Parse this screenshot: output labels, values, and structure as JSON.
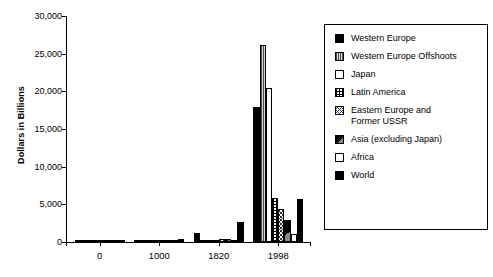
{
  "chart_data": {
    "type": "bar",
    "title": "",
    "subtitle": "",
    "xlabel": "",
    "ylabel": "Dollars in Billions",
    "categories": [
      "0",
      "1000",
      "1820",
      "1998"
    ],
    "xtick_labels": [
      "0",
      "1000",
      "1820",
      "1998"
    ],
    "ytick_labels": [
      "0",
      "5,000",
      "10,000",
      "15,000",
      "20,000",
      "25,000",
      "30,000"
    ],
    "ytick_values": [
      0,
      5000,
      10000,
      15000,
      20000,
      25000,
      30000
    ],
    "ylim": [
      0,
      30000
    ],
    "grid": false,
    "legend_position": "right",
    "series": [
      {
        "name": "Western Europe",
        "pattern": "solid",
        "values": [
          110,
          134,
          1196,
          17966
        ]
      },
      {
        "name": "Western Europe Offshoots",
        "pattern": "vstripe",
        "values": [
          14,
          16,
          189,
          26147
        ]
      },
      {
        "name": "Japan",
        "pattern": "white",
        "values": [
          12,
          32,
          205,
          20410
        ]
      },
      {
        "name": "Latin America",
        "pattern": "dots",
        "values": [
          16,
          23,
          221,
          5795
        ]
      },
      {
        "name": "Eastern Europe and\nFormer USSR",
        "pattern": "crosshatch",
        "values": [
          19,
          38,
          362,
          4354
        ]
      },
      {
        "name": "Asia (excluding Japan)",
        "pattern": "halfsolid",
        "values": [
          74,
          171,
          392,
          2937
        ]
      },
      {
        "name": "Africa",
        "pattern": "empty",
        "values": [
          11,
          19,
          76,
          1039
        ]
      },
      {
        "name": "World",
        "pattern": "world",
        "values": [
          256,
          433,
          2641,
          5709
        ]
      }
    ]
  },
  "axis": {
    "y_title": "Dollars in Billions"
  },
  "legend": {
    "items": [
      {
        "label": "Western Europe"
      },
      {
        "label": "Western Europe Offshoots"
      },
      {
        "label": "Japan"
      },
      {
        "label": "Latin America"
      },
      {
        "label": "Eastern Europe and\nFormer USSR"
      },
      {
        "label": "Asia (excluding Japan)"
      },
      {
        "label": "Africa"
      },
      {
        "label": "World"
      }
    ]
  }
}
